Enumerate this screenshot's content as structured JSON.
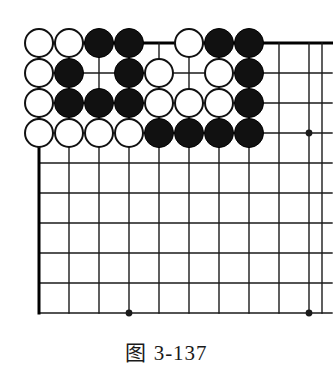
{
  "figure": {
    "caption": "图 3-137",
    "caption_label": "图",
    "caption_number": "3-137",
    "kind": "go-board-diagram"
  },
  "board": {
    "columns": 10,
    "rows": 10,
    "origin_x": 39,
    "origin_y": 43,
    "spacing": 30,
    "overflow_right": 23,
    "line_color": "#1a1a1a",
    "border_color": "#000000",
    "border_width": 3,
    "line_width": 1.4,
    "background": "#ffffff",
    "star_point_radius": 3.4,
    "star_points": [
      {
        "col": 10,
        "row": 4
      },
      {
        "col": 4,
        "row": 10
      },
      {
        "col": 10,
        "row": 10
      }
    ]
  },
  "stones": {
    "radius": 15,
    "black_color": "#111111",
    "white_color": "#ffffff",
    "rows_legend": [
      "W = white stone",
      "B = black stone",
      ". = empty point"
    ],
    "grid": [
      [
        "W",
        "W",
        "B",
        "B",
        ".",
        "W",
        "B",
        "B",
        ".",
        "."
      ],
      [
        "W",
        "B",
        ".",
        "B",
        "W",
        ".",
        "W",
        "B",
        ".",
        "."
      ],
      [
        "W",
        "B",
        "B",
        "B",
        "W",
        "W",
        "W",
        "B",
        ".",
        "."
      ],
      [
        "W",
        "W",
        "W",
        "W",
        "B",
        "B",
        "B",
        "B",
        ".",
        "."
      ],
      [
        ".",
        ".",
        ".",
        ".",
        ".",
        ".",
        ".",
        ".",
        ".",
        "."
      ],
      [
        ".",
        ".",
        ".",
        ".",
        ".",
        ".",
        ".",
        ".",
        ".",
        "."
      ],
      [
        ".",
        ".",
        ".",
        ".",
        ".",
        ".",
        ".",
        ".",
        ".",
        "."
      ],
      [
        ".",
        ".",
        ".",
        ".",
        ".",
        ".",
        ".",
        ".",
        ".",
        "."
      ],
      [
        ".",
        ".",
        ".",
        ".",
        ".",
        ".",
        ".",
        ".",
        ".",
        "."
      ],
      [
        ".",
        ".",
        ".",
        ".",
        ".",
        ".",
        ".",
        ".",
        ".",
        "."
      ]
    ],
    "list": [
      {
        "col": 1,
        "row": 1,
        "color": "white"
      },
      {
        "col": 2,
        "row": 1,
        "color": "white"
      },
      {
        "col": 3,
        "row": 1,
        "color": "black"
      },
      {
        "col": 4,
        "row": 1,
        "color": "black"
      },
      {
        "col": 6,
        "row": 1,
        "color": "white"
      },
      {
        "col": 7,
        "row": 1,
        "color": "black"
      },
      {
        "col": 8,
        "row": 1,
        "color": "black"
      },
      {
        "col": 1,
        "row": 2,
        "color": "white"
      },
      {
        "col": 2,
        "row": 2,
        "color": "black"
      },
      {
        "col": 4,
        "row": 2,
        "color": "black"
      },
      {
        "col": 5,
        "row": 2,
        "color": "white"
      },
      {
        "col": 7,
        "row": 2,
        "color": "white"
      },
      {
        "col": 8,
        "row": 2,
        "color": "black"
      },
      {
        "col": 1,
        "row": 3,
        "color": "white"
      },
      {
        "col": 2,
        "row": 3,
        "color": "black"
      },
      {
        "col": 3,
        "row": 3,
        "color": "black"
      },
      {
        "col": 4,
        "row": 3,
        "color": "black"
      },
      {
        "col": 5,
        "row": 3,
        "color": "white"
      },
      {
        "col": 6,
        "row": 3,
        "color": "white"
      },
      {
        "col": 7,
        "row": 3,
        "color": "white"
      },
      {
        "col": 8,
        "row": 3,
        "color": "black"
      },
      {
        "col": 1,
        "row": 4,
        "color": "white"
      },
      {
        "col": 2,
        "row": 4,
        "color": "white"
      },
      {
        "col": 3,
        "row": 4,
        "color": "white"
      },
      {
        "col": 4,
        "row": 4,
        "color": "white"
      },
      {
        "col": 5,
        "row": 4,
        "color": "black"
      },
      {
        "col": 6,
        "row": 4,
        "color": "black"
      },
      {
        "col": 7,
        "row": 4,
        "color": "black"
      },
      {
        "col": 8,
        "row": 4,
        "color": "black"
      }
    ]
  }
}
